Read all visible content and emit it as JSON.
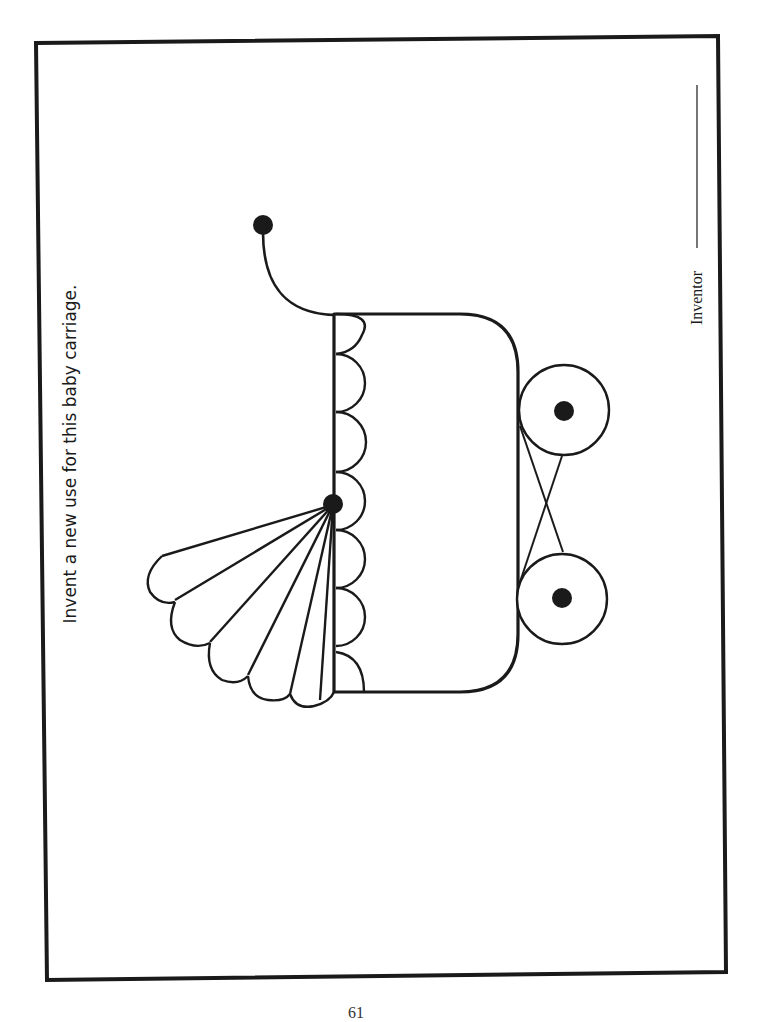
{
  "worksheet": {
    "prompt": "Invent a new use for this baby carriage.",
    "inventor_label": "Inventor",
    "page_number": "61"
  },
  "illustration": {
    "subject": "baby carriage",
    "parts": [
      "handle-with-knob",
      "scalloped-body",
      "fan-hood",
      "two-wheels",
      "crossed-axle-struts"
    ]
  },
  "colors": {
    "ink": "#1a1a1a",
    "paper": "#ffffff"
  }
}
